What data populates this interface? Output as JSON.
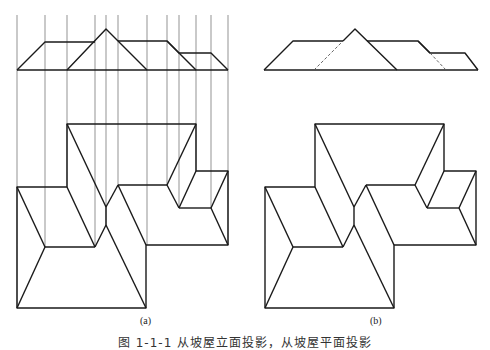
{
  "figure": {
    "label_a": "(a)",
    "label_b": "(b)",
    "caption": "图 1-1-1  从坡屋立面投影，从坡屋平面投影"
  },
  "colors": {
    "line": "#1a1a1a",
    "projection_line": "#555555",
    "background": "#ffffff"
  },
  "diagram_a": {
    "projection_lines_x": [
      17,
      45,
      67,
      95,
      106,
      118,
      147,
      167,
      179,
      196,
      211,
      228
    ],
    "projection_lines_y": [
      15,
      308
    ],
    "elevation": {
      "baseline": [
        [
          17,
          70
        ],
        [
          228,
          70
        ]
      ],
      "outline": [
        [
          17,
          70
        ],
        [
          45,
          42
        ],
        [
          95,
          42
        ],
        [
          106,
          29
        ],
        [
          147,
          70
        ]
      ],
      "segments": [
        [
          [
            67,
            70
          ],
          [
            106,
            29
          ]
        ],
        [
          [
            118,
            41
          ],
          [
            167,
            41
          ],
          [
            179,
            53
          ],
          [
            211,
            53
          ],
          [
            228,
            70
          ]
        ],
        [
          [
            106,
            29
          ],
          [
            118,
            41
          ]
        ],
        [
          [
            167,
            41
          ],
          [
            196,
            70
          ]
        ]
      ]
    }
  },
  "diagram_b": {
    "offset_x": 248
  }
}
